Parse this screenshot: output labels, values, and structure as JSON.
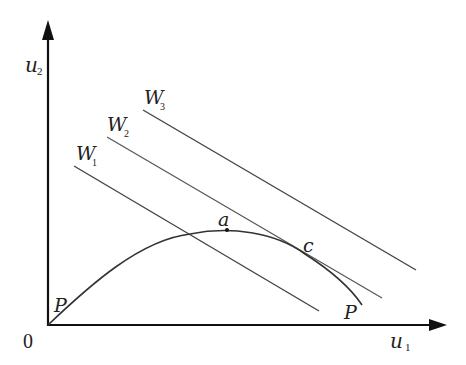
{
  "diagram": {
    "type": "utility possibility frontier with social welfare indifference curves",
    "axes": {
      "x_label": "u",
      "x_subscript": "1",
      "y_label": "u",
      "y_subscript": "2",
      "origin_label": "0"
    },
    "curve": {
      "start_label": "P",
      "end_label": "P"
    },
    "points": {
      "a": "a",
      "c": "c"
    },
    "welfare_lines": [
      {
        "label": "W",
        "subscript": "1"
      },
      {
        "label": "W",
        "subscript": "2"
      },
      {
        "label": "W",
        "subscript": "3"
      }
    ],
    "colors": {
      "axis": "#111111",
      "lines": "#444444",
      "curve": "#333333"
    }
  }
}
